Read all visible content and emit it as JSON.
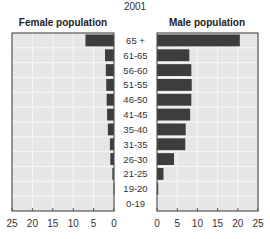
{
  "chart_data": {
    "type": "bar",
    "orientation": "horizontal",
    "subtype": "population-pyramid",
    "title": "2001",
    "categories": [
      "65 +",
      "61-65",
      "56-60",
      "51-55",
      "46-50",
      "41-45",
      "35-40",
      "31-35",
      "26-30",
      "21-25",
      "19-20",
      "0-19"
    ],
    "series": [
      {
        "name": "Female population",
        "values": [
          7,
          2.2,
          2,
          1.9,
          1.8,
          1.7,
          1.5,
          1,
          0.9,
          0.4,
          0.1,
          0
        ]
      },
      {
        "name": "Male population",
        "values": [
          20.5,
          8,
          8.5,
          8.6,
          8.5,
          8.2,
          7.1,
          7,
          4.2,
          1.6,
          0.3,
          0
        ]
      }
    ],
    "xlim": [
      0,
      25
    ],
    "x_ticks": [
      0,
      5,
      10,
      15,
      20,
      25
    ],
    "x_ticks_left": [
      25,
      20,
      15,
      10,
      5,
      0
    ],
    "xlabel": "",
    "ylabel": "",
    "grid": true,
    "colors": {
      "bar": "#3d3d3d",
      "plot_bg": "#e6e6e6",
      "grid": "#f7f7f7",
      "frame": "#555555"
    }
  }
}
